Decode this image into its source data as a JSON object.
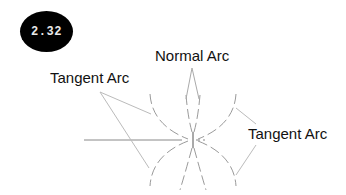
{
  "badge": {
    "text": "2.32"
  },
  "labels": {
    "normal_arc": "Normal Arc",
    "tangent_arc_left": "Tangent Arc",
    "tangent_arc_right": "Tangent Arc"
  },
  "colors": {
    "badge_bg": "#000000",
    "badge_text": "#e8e8e8",
    "arc_stroke": "#9a9a9a",
    "leader_stroke": "#bbbbbb",
    "text": "#111111"
  }
}
